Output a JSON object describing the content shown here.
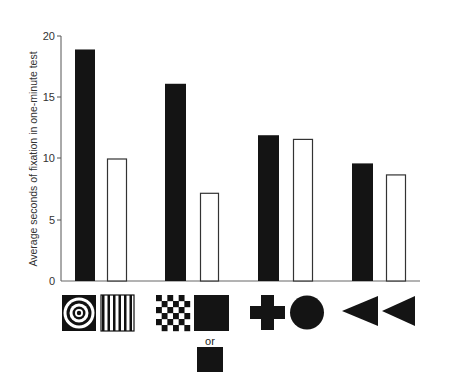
{
  "chart_data": {
    "type": "bar",
    "title": "",
    "xlabel": "",
    "ylabel": "Average seconds of fixation in one-minute test",
    "ylim": [
      0,
      20
    ],
    "yticks": [
      0,
      5,
      10,
      15,
      20
    ],
    "grid": false,
    "legend": null,
    "categories": [
      "Bullseye vs. stripes",
      "Checkerboard vs. plain square",
      "Cross vs. circle",
      "Triangle vs. triangle"
    ],
    "series": [
      {
        "name": "First (left, black bar) stimulus",
        "color": "#141414",
        "values": [
          18.9,
          16.1,
          11.9,
          9.6
        ]
      },
      {
        "name": "Second (right, white bar) stimulus",
        "color": "#ffffff",
        "values": [
          10.0,
          7.2,
          11.6,
          8.7
        ]
      }
    ],
    "stimuli": [
      {
        "left": "bullseye",
        "right": "vertical-stripes"
      },
      {
        "left": "checkerboard",
        "right": "plain-black-square",
        "alternate": "small-plain-black-square"
      },
      {
        "left": "cross",
        "right": "circle"
      },
      {
        "left": "triangle",
        "right": "triangle"
      }
    ],
    "annotations": [
      "or"
    ]
  },
  "labels": {
    "ytick_0": "0",
    "ytick_5": "5",
    "ytick_10": "10",
    "ytick_15": "15",
    "ytick_20": "20",
    "ylabel": "Average seconds of fixation in one-minute test",
    "or": "or"
  }
}
